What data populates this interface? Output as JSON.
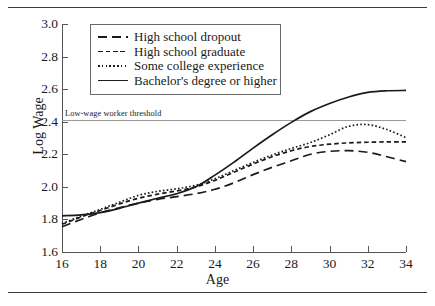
{
  "figure": {
    "y_axis_title": "Log Wage",
    "x_axis_title": "Age"
  },
  "threshold": {
    "label": "Low-wage worker threshold",
    "value": 2.41,
    "color": "#9a9a9a"
  },
  "legend": {
    "items": [
      {
        "label": "High school dropout",
        "style": "long-dash"
      },
      {
        "label": "High school graduate",
        "style": "dash"
      },
      {
        "label": "Some college experience",
        "style": "dot"
      },
      {
        "label": "Bachelor's degree or higher",
        "style": "solid"
      }
    ]
  },
  "chart_data": {
    "type": "line",
    "title": "",
    "xlabel": "Age",
    "ylabel": "Log Wage",
    "xlim": [
      16,
      34
    ],
    "ylim": [
      1.6,
      3.0
    ],
    "xticks": [
      16,
      18,
      20,
      22,
      24,
      26,
      28,
      30,
      32,
      34
    ],
    "yticks": [
      1.6,
      1.8,
      2.0,
      2.2,
      2.4,
      2.6,
      2.8,
      3.0
    ],
    "grid": false,
    "legend_position": "upper-center",
    "annotations": [
      {
        "text": "Low-wage worker threshold",
        "y": 2.41,
        "type": "hline"
      }
    ],
    "x": [
      16,
      17,
      18,
      19,
      20,
      21,
      22,
      23,
      24,
      25,
      26,
      27,
      28,
      29,
      30,
      31,
      32,
      33,
      34
    ],
    "series": [
      {
        "name": "High school dropout",
        "style": "long-dash",
        "color": "#1a1a1a",
        "values": [
          1.755,
          1.8,
          1.84,
          1.872,
          1.9,
          1.923,
          1.94,
          1.958,
          1.985,
          2.025,
          2.075,
          2.12,
          2.16,
          2.2,
          2.218,
          2.222,
          2.212,
          2.185,
          2.155
        ]
      },
      {
        "name": "High school graduate",
        "style": "dash",
        "color": "#1a1a1a",
        "values": [
          1.77,
          1.815,
          1.855,
          1.895,
          1.93,
          1.955,
          1.975,
          2.0,
          2.04,
          2.09,
          2.14,
          2.185,
          2.222,
          2.248,
          2.262,
          2.27,
          2.274,
          2.276,
          2.276
        ]
      },
      {
        "name": "Some college experience",
        "style": "dot",
        "color": "#1a1a1a",
        "values": [
          1.775,
          1.82,
          1.862,
          1.905,
          1.948,
          1.972,
          1.988,
          2.01,
          2.05,
          2.1,
          2.15,
          2.196,
          2.236,
          2.272,
          2.32,
          2.372,
          2.382,
          2.352,
          2.302
        ]
      },
      {
        "name": "Bachelor's degree or higher",
        "style": "solid",
        "color": "#1a1a1a",
        "values": [
          1.822,
          1.828,
          1.842,
          1.868,
          1.9,
          1.93,
          1.958,
          2.0,
          2.072,
          2.152,
          2.238,
          2.32,
          2.396,
          2.462,
          2.512,
          2.552,
          2.58,
          2.59,
          2.592
        ]
      }
    ]
  }
}
